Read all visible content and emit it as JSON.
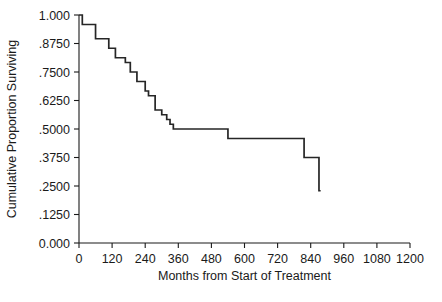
{
  "chart_data": {
    "type": "line",
    "title": "",
    "subtitle": "",
    "xlabel": "Months from Start of Treatment",
    "ylabel": "Cumulative Proportion Surviving",
    "xlim": [
      0,
      1200
    ],
    "ylim": [
      0,
      1.0
    ],
    "grid": false,
    "legend": null,
    "x_ticks": [
      0,
      120,
      240,
      360,
      480,
      600,
      720,
      840,
      960,
      1080,
      1200
    ],
    "x_tick_labels": [
      "0",
      "120",
      "240",
      "360",
      "480",
      "600",
      "720",
      "840",
      "960",
      "1080",
      "1200"
    ],
    "y_ticks": [
      0,
      0.125,
      0.25,
      0.375,
      0.5,
      0.625,
      0.75,
      0.875,
      1.0
    ],
    "y_tick_labels": [
      "0.000",
      ".1250",
      ".2500",
      ".3750",
      ".5000",
      ".6250",
      ".7500",
      ".8750",
      "1.000"
    ],
    "series": [
      {
        "name": "Kaplan-Meier survival curve",
        "style": "step-post",
        "color": "#262626",
        "x": [
          0,
          12,
          18,
          60,
          66,
          108,
          114,
          132,
          138,
          168,
          174,
          186,
          192,
          210,
          216,
          240,
          246,
          252,
          258,
          276,
          282,
          300,
          306,
          318,
          324,
          330,
          336,
          342,
          348,
          540,
          546,
          816,
          822,
          870,
          876
        ],
        "y": [
          1.0,
          1.0,
          0.9583,
          0.9583,
          0.8958,
          0.8958,
          0.8542,
          0.8542,
          0.8125,
          0.8125,
          0.7917,
          0.7917,
          0.75,
          0.75,
          0.7083,
          0.7083,
          0.6667,
          0.6667,
          0.6458,
          0.6458,
          0.5833,
          0.5833,
          0.5625,
          0.5625,
          0.5417,
          0.5417,
          0.5208,
          0.5208,
          0.5,
          0.5,
          0.4583,
          0.4583,
          0.375,
          0.375,
          0.2292
        ],
        "points": [
          {
            "x": 0,
            "y": 1.0
          },
          {
            "x": 12,
            "y": 1.0
          },
          {
            "x": 18,
            "y": 0.9583
          },
          {
            "x": 60,
            "y": 0.9583
          },
          {
            "x": 66,
            "y": 0.8958
          },
          {
            "x": 108,
            "y": 0.8958
          },
          {
            "x": 114,
            "y": 0.8542
          },
          {
            "x": 132,
            "y": 0.8542
          },
          {
            "x": 138,
            "y": 0.8125
          },
          {
            "x": 168,
            "y": 0.8125
          },
          {
            "x": 174,
            "y": 0.7917
          },
          {
            "x": 186,
            "y": 0.7917
          },
          {
            "x": 192,
            "y": 0.75
          },
          {
            "x": 210,
            "y": 0.75
          },
          {
            "x": 216,
            "y": 0.7083
          },
          {
            "x": 240,
            "y": 0.7083
          },
          {
            "x": 246,
            "y": 0.6667
          },
          {
            "x": 252,
            "y": 0.6667
          },
          {
            "x": 258,
            "y": 0.6458
          },
          {
            "x": 276,
            "y": 0.6458
          },
          {
            "x": 282,
            "y": 0.5833
          },
          {
            "x": 300,
            "y": 0.5833
          },
          {
            "x": 306,
            "y": 0.5625
          },
          {
            "x": 318,
            "y": 0.5625
          },
          {
            "x": 324,
            "y": 0.5417
          },
          {
            "x": 330,
            "y": 0.5417
          },
          {
            "x": 336,
            "y": 0.5208
          },
          {
            "x": 342,
            "y": 0.5208
          },
          {
            "x": 348,
            "y": 0.5
          },
          {
            "x": 540,
            "y": 0.5
          },
          {
            "x": 546,
            "y": 0.4583
          },
          {
            "x": 816,
            "y": 0.4583
          },
          {
            "x": 822,
            "y": 0.375
          },
          {
            "x": 870,
            "y": 0.375
          },
          {
            "x": 876,
            "y": 0.2292
          }
        ]
      }
    ]
  }
}
